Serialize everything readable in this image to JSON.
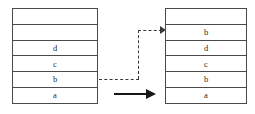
{
  "diagram": {
    "stack_before": {
      "name": "left-stack",
      "cells": [
        {
          "label": ""
        },
        {
          "label": ""
        },
        {
          "label": "d"
        },
        {
          "label": "c"
        },
        {
          "label": "b"
        },
        {
          "label": "a"
        }
      ]
    },
    "stack_after": {
      "name": "right-stack",
      "cells": [
        {
          "label": ""
        },
        {
          "label": "b"
        },
        {
          "label": "d"
        },
        {
          "label": "c"
        },
        {
          "label": "b"
        },
        {
          "label": "a"
        }
      ]
    },
    "connectors": {
      "dashed_copy_arrow": {
        "label": "",
        "style": "dashed",
        "color": "#3a3a3a",
        "from": "left-stack-cell-b",
        "to": "right-stack-cell-b-top"
      },
      "solid_transform_arrow": {
        "label": "",
        "style": "solid",
        "color": "#161616",
        "from": "left-stack",
        "to": "right-stack"
      }
    },
    "colors": {
      "border": "#4a4a4a",
      "text": "#2b2b2b",
      "background": "#ffffff",
      "dashed_arrow": "#3a3a3a",
      "solid_arrow": "#161616"
    }
  }
}
